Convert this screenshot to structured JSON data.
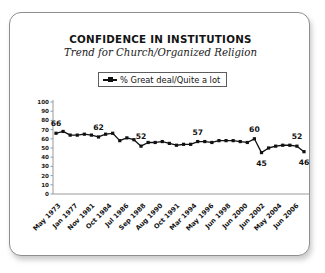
{
  "card": {
    "title": "CONFIDENCE IN INSTITUTIONS",
    "subtitle": "Trend for Church/Organized Religion"
  },
  "legend": {
    "marker_icon": "line-square-marker-icon",
    "label": "% Great deal/Quite a lot"
  },
  "colors": {
    "series": "#111111",
    "axis": "#9a9a9a",
    "card_border": "#8e8e8e",
    "background": "#ffffff",
    "text": "#141414"
  },
  "chart_data": {
    "type": "line",
    "title": "CONFIDENCE IN INSTITUTIONS",
    "subtitle": "Trend for Church/Organized Religion",
    "xlabel": "",
    "ylabel": "",
    "ylim": [
      0,
      100
    ],
    "yticks": [
      0,
      10,
      20,
      30,
      40,
      50,
      60,
      70,
      80,
      90,
      100
    ],
    "grid": false,
    "legend_position": "top-center",
    "series": [
      {
        "name": "% Great deal/Quite a lot",
        "marker": "square",
        "values": [
          66,
          68,
          64,
          64,
          65,
          64,
          62,
          65,
          66,
          58,
          61,
          59,
          52,
          56,
          56,
          57,
          55,
          53,
          54,
          54,
          57,
          57,
          56,
          58,
          58,
          58,
          57,
          56,
          60,
          45,
          50,
          52,
          53,
          53,
          52,
          46
        ]
      }
    ],
    "xticks": [
      "May 1973",
      "Jan 1977",
      "Nov 1981",
      "Oct 1984",
      "Jul 1986",
      "Sep 1988",
      "Aug 1990",
      "Oct 1991",
      "Mar 1994",
      "May 1996",
      "Jun 1998",
      "Jun 2000",
      "Jun 2002",
      "May 2004",
      "Jun 2006"
    ],
    "point_labels": [
      {
        "text": "66",
        "index": 0,
        "value": 66,
        "position": "above"
      },
      {
        "text": "62",
        "index": 6,
        "value": 62,
        "position": "above"
      },
      {
        "text": "52",
        "index": 12,
        "value": 52,
        "position": "above"
      },
      {
        "text": "57",
        "index": 20,
        "value": 57,
        "position": "above"
      },
      {
        "text": "60",
        "index": 28,
        "value": 60,
        "position": "above"
      },
      {
        "text": "45",
        "index": 29,
        "value": 45,
        "position": "below"
      },
      {
        "text": "52",
        "index": 34,
        "value": 52,
        "position": "above"
      },
      {
        "text": "46",
        "index": 35,
        "value": 46,
        "position": "below"
      }
    ]
  }
}
